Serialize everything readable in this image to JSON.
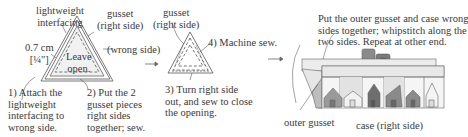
{
  "step1_panel": {
    "label_interfacing": "lightweight\ninterfacing",
    "label_gusset": "gusset\n(right side)",
    "label_seam": "0.7 cm\n[¼\"]",
    "label_wrong_side": "(wrong side)",
    "label_leave_open": "Leave\nopen.",
    "step1": "1) Attach the\nlightweight\ninterfacing to\nwrong side.",
    "step2": "2) Put the 2\ngusset pieces\nright sides\ntogether; sew."
  },
  "step2_panel": {
    "label_gusset": "gusset\n(right side)",
    "step4": "4) Machine sew.",
    "step3": "3) Turn right side\nout, and sew to close\nthe opening."
  },
  "step3_panel": {
    "instruction": "Put the outer gusset and case wrong\nsides together; whipstitch along the\ntwo sides. Repeat at other end.",
    "label_outer_gusset": "outer gusset",
    "label_case": "case (right side)"
  },
  "arrows": [
    "arrow-right",
    "arrow-right"
  ],
  "colors": {
    "line": "#555555",
    "house_dark": "#6e6e6e",
    "house_mid": "#9a9a9a",
    "house_light": "#f2f2f2",
    "panel_light": "#d9d9d9"
  }
}
